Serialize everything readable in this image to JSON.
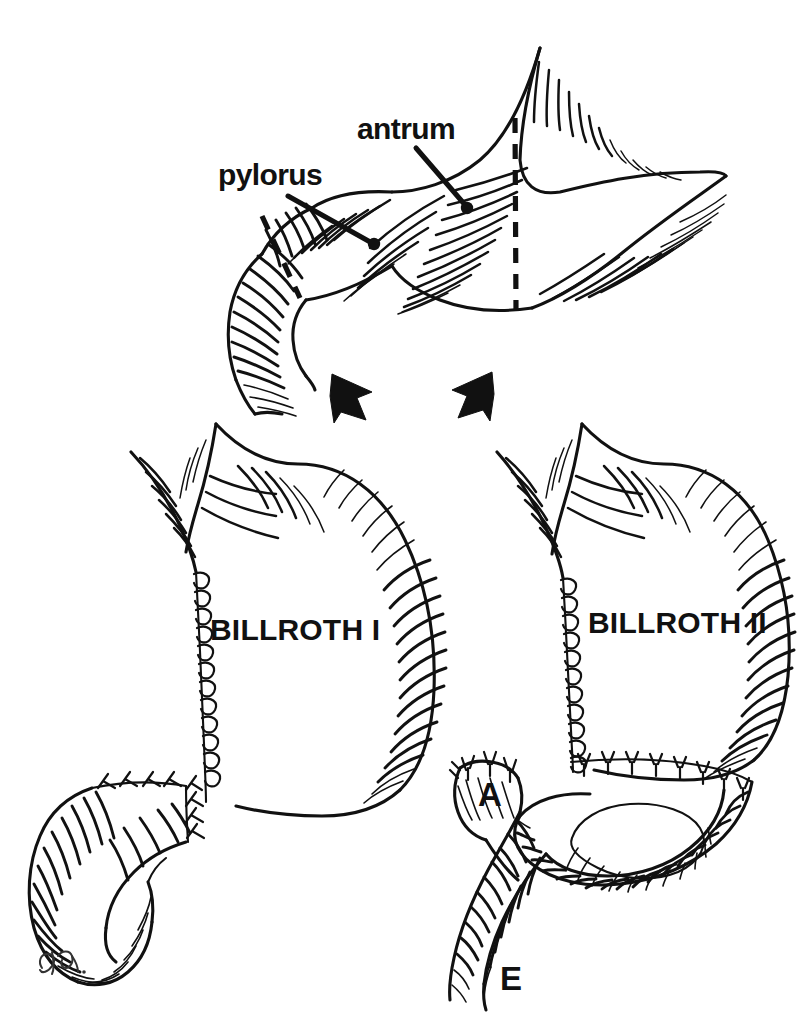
{
  "figure": {
    "background_color": "#ffffff",
    "ink_color": "#111111",
    "style": "pen-and-ink medical line illustration"
  },
  "panels": {
    "top": {
      "name": "distal stomach before resection",
      "labels": [
        {
          "id": "antrum",
          "text": "antrum",
          "x": 357,
          "y": 138,
          "leader_from": [
            416,
            148
          ],
          "leader_to": [
            466,
            207
          ]
        },
        {
          "id": "pylorus",
          "text": "pylorus",
          "x": 218,
          "y": 184,
          "leader_from": [
            288,
            196
          ],
          "leader_to": [
            373,
            244
          ]
        }
      ],
      "resection_lines": [
        {
          "id": "proximal-resection-line",
          "label": "dashed resection line at gastric body"
        },
        {
          "id": "distal-resection-line",
          "label": "dashed resection line at pylorus"
        }
      ]
    },
    "arrows": [
      {
        "id": "arrow-to-billroth-1",
        "direction": "down-left",
        "x": 352,
        "y": 400
      },
      {
        "id": "arrow-to-billroth-2",
        "direction": "down-right",
        "x": 470,
        "y": 396
      }
    ],
    "bottom_left": {
      "name": "billroth-i",
      "label": "BILLROTH I",
      "label_x": 210,
      "label_y": 640,
      "anastomosis": "gastroduodenostomy"
    },
    "bottom_right": {
      "name": "billroth-ii",
      "label": "BILLROTH II",
      "label_x": 588,
      "label_y": 632,
      "anastomosis": "gastrojejunostomy",
      "limb_labels": [
        {
          "id": "afferent-limb",
          "text": "A",
          "x": 478,
          "y": 805
        },
        {
          "id": "efferent-limb",
          "text": "E",
          "x": 500,
          "y": 988
        }
      ]
    }
  },
  "signature": {
    "id": "artist-signature",
    "text": "",
    "x": 40,
    "y": 965
  }
}
